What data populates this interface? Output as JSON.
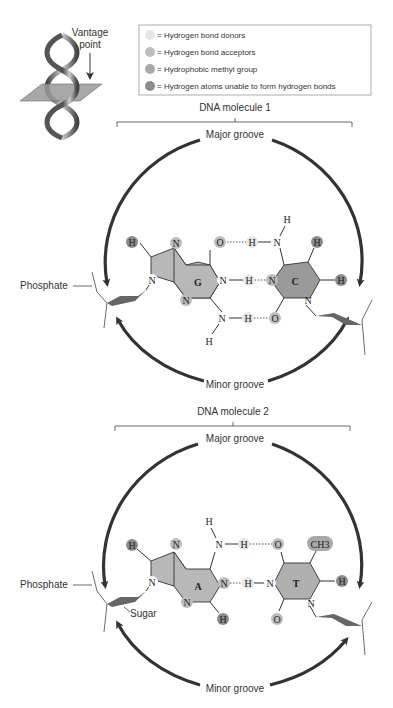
{
  "vantage": {
    "label_line1": "Vantage",
    "label_line2": "point"
  },
  "legend": {
    "items": [
      {
        "label": "= Hydrogen bond donors",
        "color": "#e6e6e6"
      },
      {
        "label": "= Hydrogen bond acceptors",
        "color": "#bdbdbd"
      },
      {
        "label": "= Hydrophobic methyl group",
        "color": "#a9a9a9"
      },
      {
        "label": "= Hydrogen atoms unable to form hydrogen bonds",
        "color": "#8c8c8c"
      }
    ]
  },
  "molecule1": {
    "title": "DNA molecule 1",
    "major_groove": "Major groove",
    "minor_groove": "Minor groove",
    "phosphate": "Phosphate",
    "purine": "G",
    "pyrimidine": "C"
  },
  "molecule2": {
    "title": "DNA molecule 2",
    "major_groove": "Major groove",
    "minor_groove": "Minor groove",
    "phosphate": "Phosphate",
    "sugar": "Sugar",
    "purine": "A",
    "pyrimidine": "T",
    "methyl": "CH3"
  },
  "atoms": {
    "H": "H",
    "N": "N",
    "O": "O"
  },
  "colors": {
    "purine_fill": "#b8b8b8",
    "pyrimidine_c_fill": "#9a9a9a",
    "pyrimidine_t_fill": "#b0b0b0",
    "arc": "#333333"
  }
}
